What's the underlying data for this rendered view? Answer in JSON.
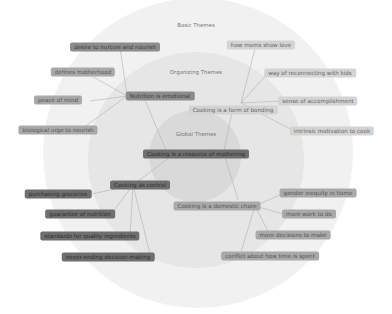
{
  "rings": {
    "basic": "Basic Themes",
    "organizing": "Organizing Themes",
    "global": "Global Themes"
  },
  "global_theme": "Cooking is a resource of mothering",
  "organizing_themes": [
    {
      "label": "Nutrition is emotional"
    },
    {
      "label": "Cooking is a form of bonding"
    },
    {
      "label": "Cooking as control"
    },
    {
      "label": "Cooking is a domestic chore"
    }
  ],
  "basic_themes": {
    "nutrition": [
      "desire to nurture and nourish",
      "defines motherhood",
      "peace of mind",
      "biological urge to nourish"
    ],
    "bonding": [
      "how moms show love",
      "way of reconnecting with kids",
      "sense of accomplishment",
      "intrinsic motivation to cook"
    ],
    "control": [
      "purchasing groceries",
      "guarantee of nutrition",
      "standards for quality ingredients",
      "never-ending decision-making"
    ],
    "chore": [
      "gender inequity in home",
      "more work to do",
      "more decisions to make",
      "conflict about how time is spent"
    ]
  },
  "colors": {
    "outer_ring": "#f1f1f1",
    "middle_ring": "#e6e6e6",
    "inner_ring": "#d9d9d9",
    "link": "#b0b0b0"
  }
}
